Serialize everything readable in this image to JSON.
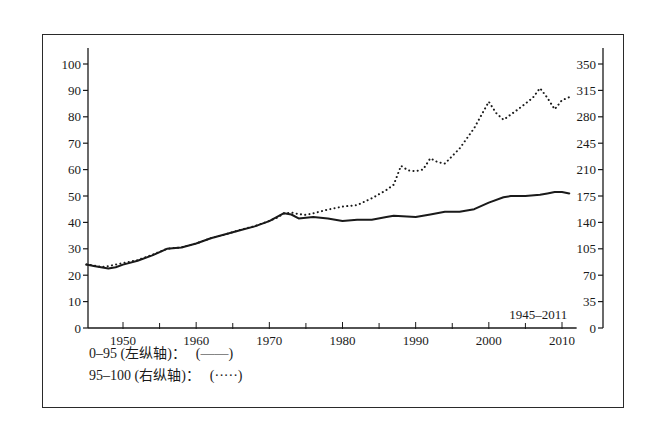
{
  "chart_data": {
    "type": "line",
    "title": "",
    "annotation": "1945–2011",
    "xlabel": "",
    "ylabel_left": "",
    "ylabel_right": "",
    "x_ticks": [
      1950,
      1960,
      1970,
      1980,
      1990,
      2000,
      2010
    ],
    "x_range": [
      1945,
      2011
    ],
    "y_left": {
      "range": [
        0,
        100
      ],
      "ticks": [
        0,
        10,
        20,
        30,
        40,
        50,
        60,
        70,
        80,
        90,
        100
      ]
    },
    "y_right": {
      "range": [
        0,
        350
      ],
      "ticks": [
        0,
        35,
        70,
        105,
        140,
        175,
        210,
        245,
        280,
        315,
        350
      ]
    },
    "grid": false,
    "legend_position": "bottom-left",
    "series": [
      {
        "name": "0-95 (左纵轴)",
        "axis": "left",
        "style": "solid",
        "x": [
          1945,
          1946,
          1947,
          1948,
          1949,
          1950,
          1952,
          1954,
          1956,
          1958,
          1960,
          1962,
          1964,
          1966,
          1968,
          1970,
          1971,
          1972,
          1973,
          1974,
          1976,
          1978,
          1980,
          1982,
          1984,
          1986,
          1987,
          1990,
          1992,
          1994,
          1996,
          1998,
          2000,
          2002,
          2003,
          2005,
          2007,
          2008,
          2009,
          2010,
          2011
        ],
        "values": [
          24,
          23.5,
          23,
          22.5,
          23,
          24,
          25.5,
          27.5,
          30,
          30.5,
          32,
          34,
          35.5,
          37,
          38.5,
          40.5,
          42,
          43.5,
          43,
          41.5,
          42,
          41.5,
          40.5,
          41,
          41,
          42,
          42.5,
          42,
          43,
          44,
          44,
          45,
          47.5,
          49.5,
          50,
          50,
          50.5,
          51,
          51.5,
          51.5,
          51
        ]
      },
      {
        "name": "95-100 (右纵轴)",
        "axis": "right",
        "style": "dotted",
        "x": [
          1945,
          1946,
          1947,
          1948,
          1949,
          1950,
          1952,
          1954,
          1956,
          1958,
          1960,
          1962,
          1964,
          1966,
          1968,
          1970,
          1971,
          1972,
          1973,
          1974,
          1975,
          1976,
          1978,
          1980,
          1982,
          1984,
          1986,
          1987,
          1988,
          1989,
          1990,
          1991,
          1992,
          1993,
          1994,
          1996,
          1998,
          2000,
          2001,
          2002,
          2004,
          2006,
          2007,
          2008,
          2009,
          2010,
          2011
        ],
        "values": [
          84,
          83,
          81,
          82,
          84,
          86,
          90,
          97,
          105,
          107,
          112,
          119,
          124,
          130,
          135,
          142,
          146,
          152,
          153,
          151,
          150,
          152,
          157,
          161,
          163,
          172,
          183,
          190,
          215,
          209,
          208,
          210,
          225,
          220,
          218,
          238,
          265,
          300,
          285,
          276,
          290,
          305,
          318,
          305,
          290,
          302,
          306
        ]
      }
    ]
  },
  "legend": {
    "items": [
      {
        "label": "0–95 (左纵轴)：",
        "symbol": "(——)"
      },
      {
        "label": "95–100 (右纵轴)：",
        "symbol": "(·····)"
      }
    ]
  },
  "colors": {
    "ink": "#1a1a1a",
    "background": "#ffffff"
  }
}
